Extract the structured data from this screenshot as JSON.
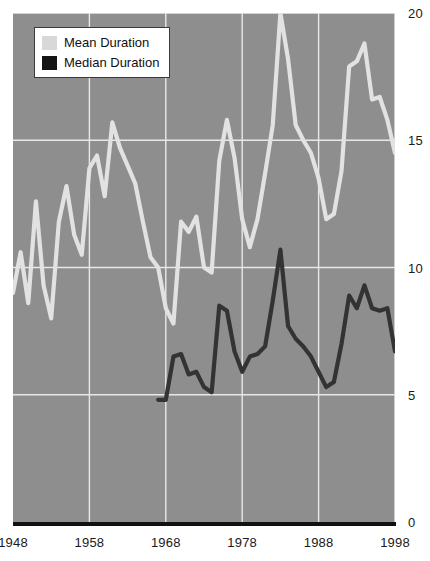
{
  "chart_data": {
    "type": "line",
    "title": "",
    "subtitle": "",
    "xlabel": "",
    "ylabel": "",
    "xlim": [
      1948,
      1998
    ],
    "ylim": [
      0,
      20
    ],
    "grid": true,
    "legend_position": "top-left",
    "x_ticks": [
      "1948",
      "1958",
      "1968",
      "1978",
      "1988",
      "1998"
    ],
    "x_tick_values": [
      1948,
      1958,
      1968,
      1978,
      1988,
      1998
    ],
    "y_ticks": [
      "0",
      "5",
      "10",
      "15",
      "20"
    ],
    "y_tick_values": [
      0,
      5,
      10,
      15,
      20
    ],
    "series": [
      {
        "name": "Mean Duration",
        "color": "#e2e2e2",
        "x": [
          1948,
          1949,
          1950,
          1951,
          1952,
          1953,
          1954,
          1955,
          1956,
          1957,
          1958,
          1959,
          1960,
          1961,
          1962,
          1963,
          1964,
          1965,
          1966,
          1967,
          1968,
          1969,
          1970,
          1971,
          1972,
          1973,
          1974,
          1975,
          1976,
          1977,
          1978,
          1979,
          1980,
          1981,
          1982,
          1983,
          1984,
          1985,
          1986,
          1987,
          1988,
          1989,
          1990,
          1991,
          1992,
          1993,
          1994,
          1995,
          1996,
          1997,
          1998
        ],
        "values": [
          9.0,
          10.6,
          8.6,
          12.6,
          9.3,
          8.0,
          11.8,
          13.2,
          11.3,
          10.5,
          13.9,
          14.4,
          12.8,
          15.7,
          14.7,
          14.0,
          13.3,
          11.8,
          10.4,
          10.0,
          8.4,
          7.8,
          11.8,
          11.4,
          12.0,
          10.0,
          9.8,
          14.2,
          15.8,
          14.3,
          11.9,
          10.8,
          11.9,
          13.7,
          15.6,
          20.0,
          18.2,
          15.6,
          15.0,
          14.5,
          13.5,
          11.9,
          12.1,
          13.8,
          17.9,
          18.1,
          18.8,
          16.6,
          16.7,
          15.8,
          14.5
        ]
      },
      {
        "name": "Median Duration",
        "color": "#333333",
        "x": [
          1967,
          1968,
          1969,
          1970,
          1971,
          1972,
          1973,
          1974,
          1975,
          1976,
          1977,
          1978,
          1979,
          1980,
          1981,
          1982,
          1983,
          1984,
          1985,
          1986,
          1987,
          1988,
          1989,
          1990,
          1991,
          1992,
          1993,
          1994,
          1995,
          1996,
          1997,
          1998
        ],
        "values": [
          4.8,
          4.8,
          6.5,
          6.6,
          5.8,
          5.9,
          5.3,
          5.1,
          8.5,
          8.3,
          6.7,
          5.9,
          6.5,
          6.6,
          6.9,
          8.7,
          10.7,
          7.7,
          7.2,
          6.9,
          6.5,
          5.9,
          5.3,
          5.5,
          7.0,
          8.9,
          8.4,
          9.3,
          8.4,
          8.3,
          8.4,
          6.7
        ]
      }
    ]
  },
  "legend": {
    "items": [
      {
        "label": "Mean Duration",
        "swatch": "mean-swatch"
      },
      {
        "label": "Median Duration",
        "swatch": "median-swatch"
      }
    ]
  },
  "colors": {
    "plot_background": "#8e8e8e",
    "gridline": "#e8e8e8",
    "axis_baseline": "#111111",
    "mean_series": "#e2e2e2",
    "median_series": "#333333",
    "page_background": "#ffffff",
    "tick_text": "#1a1a1a"
  }
}
